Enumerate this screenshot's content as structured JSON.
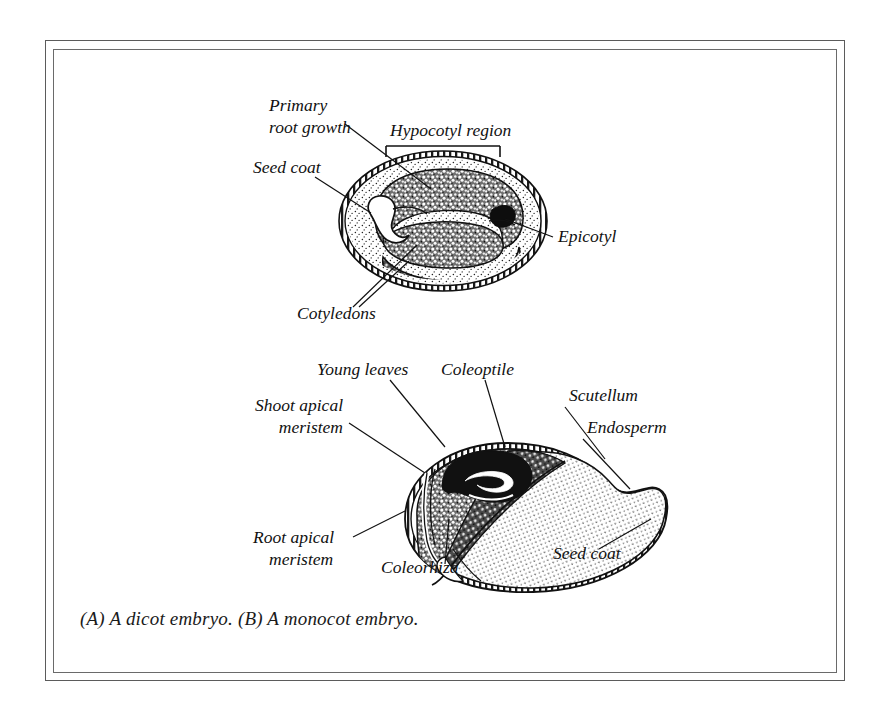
{
  "figure": {
    "caption": "(A) A dicot embryo. (B) A monocot embryo.",
    "background_color": "#ffffff",
    "ink_color": "#111111",
    "frame_color": "#5b5b5b"
  },
  "diagram_a": {
    "name": "dicot-embryo",
    "labels": {
      "primary_root_growth_line1": "Primary",
      "primary_root_growth_line2": "root growth",
      "seed_coat": "Seed coat",
      "hypocotyl_region": "Hypocotyl region",
      "epicotyl": "Epicotyl",
      "cotyledons": "Cotyledons"
    }
  },
  "diagram_b": {
    "name": "monocot-embryo",
    "labels": {
      "young_leaves": "Young leaves",
      "coleoptile": "Coleoptile",
      "shoot_apical_meristem_line1": "Shoot apical",
      "shoot_apical_meristem_line2": "meristem",
      "scutellum": "Scutellum",
      "endosperm": "Endosperm",
      "root_apical_meristem_line1": "Root apical",
      "root_apical_meristem_line2": "meristem",
      "coleorhiza": "Coleorhiza",
      "seed_coat": "Seed coat"
    }
  }
}
